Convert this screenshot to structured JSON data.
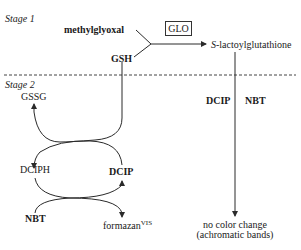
{
  "stage1": {
    "label": "Stage 1",
    "reactant_a": "methylglyoxal",
    "reactant_b": "GSH",
    "enzyme": "GLO",
    "product_prefix": "S",
    "product_rest": "-lactoylglutathione"
  },
  "stage2": {
    "label": "Stage 2",
    "left_cycle": {
      "gssg": "GSSG",
      "dciph": "DCIPH",
      "dcip": "DCIP",
      "nbt": "NBT",
      "formazan": "formazan",
      "formazan_sup": "VIS"
    },
    "right_branch": {
      "reagent_a": "DCIP",
      "reagent_b": "NBT",
      "result_line1": "no color change",
      "result_line2": "(achromatic bands)"
    }
  },
  "colors": {
    "line": "#2a2a2a",
    "text": "#1a1a1a",
    "background": "#ffffff"
  }
}
